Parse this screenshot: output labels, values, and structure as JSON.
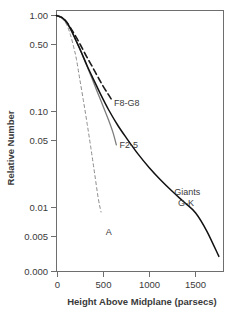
{
  "chart_data": {
    "type": "line",
    "title": "",
    "xlabel": "Height Above Midplane (parsecs)",
    "ylabel": "Relative Number",
    "yscale": "log",
    "xscale": "linear",
    "xlim": [
      0,
      1800
    ],
    "ylim": [
      0.003,
      1.0
    ],
    "grid": false,
    "legend_position": "inline-annotations",
    "xticks": [
      0,
      500,
      1000,
      1500
    ],
    "xtick_labels": [
      "0",
      "500",
      "1000",
      "1500"
    ],
    "yticks": [
      1.0,
      0.5,
      0.1,
      0.05,
      0.01,
      0.005,
      0.0
    ],
    "ytick_labels": [
      "1.00",
      "0.50",
      "0.10",
      "0.05",
      "0.01",
      "0.005",
      "0.000"
    ],
    "series": [
      {
        "name": "A",
        "label": "A",
        "style": "dashed",
        "color": "#8a8a8a",
        "width": 1.0,
        "x": [
          0,
          60,
          110,
          150,
          185,
          215,
          250,
          290,
          330,
          370,
          410,
          450,
          480
        ],
        "values": [
          1.0,
          0.93,
          0.8,
          0.63,
          0.47,
          0.35,
          0.22,
          0.13,
          0.075,
          0.042,
          0.023,
          0.0125,
          0.009
        ]
      },
      {
        "name": "F8-G8",
        "label": "F8-G8",
        "style": "dashed",
        "color": "#1c1c1c",
        "width": 1.6,
        "x": [
          0,
          60,
          110,
          160,
          210,
          260,
          320,
          380,
          440,
          500,
          560,
          600
        ],
        "values": [
          1.0,
          0.95,
          0.85,
          0.72,
          0.6,
          0.49,
          0.38,
          0.3,
          0.235,
          0.185,
          0.15,
          0.13
        ]
      },
      {
        "name": "F2-5",
        "label": "F2-5",
        "style": "solid",
        "color": "#7d7d7d",
        "width": 1.3,
        "x": [
          0,
          60,
          110,
          160,
          210,
          260,
          320,
          380,
          440,
          500,
          560,
          610,
          645
        ],
        "values": [
          1.0,
          0.94,
          0.84,
          0.69,
          0.55,
          0.43,
          0.31,
          0.225,
          0.16,
          0.115,
          0.082,
          0.06,
          0.045
        ]
      },
      {
        "name": "Giants G-K",
        "label": "Giants G-K",
        "label_line1": "Giants",
        "label_line2": "G-K",
        "style": "solid",
        "color": "#111111",
        "width": 1.5,
        "x": [
          0,
          60,
          110,
          160,
          210,
          270,
          330,
          400,
          480,
          560,
          660,
          760,
          880,
          1000,
          1120,
          1250,
          1380,
          1500,
          1620,
          1750
        ],
        "values": [
          1.0,
          0.95,
          0.85,
          0.7,
          0.55,
          0.41,
          0.3,
          0.215,
          0.148,
          0.105,
          0.072,
          0.052,
          0.036,
          0.026,
          0.0195,
          0.0147,
          0.0113,
          0.0088,
          0.0057,
          0.0031
        ]
      }
    ],
    "annotations": [
      {
        "text": "F8-G8",
        "x": 620,
        "y": 0.115
      },
      {
        "text": "F2-5",
        "x": 680,
        "y": 0.042
      },
      {
        "text": "Giants",
        "x": 1270,
        "y": 0.0135
      },
      {
        "text": "G-K",
        "x": 1310,
        "y": 0.0103
      },
      {
        "text": "A",
        "x": 530,
        "y": 0.0052
      }
    ]
  }
}
